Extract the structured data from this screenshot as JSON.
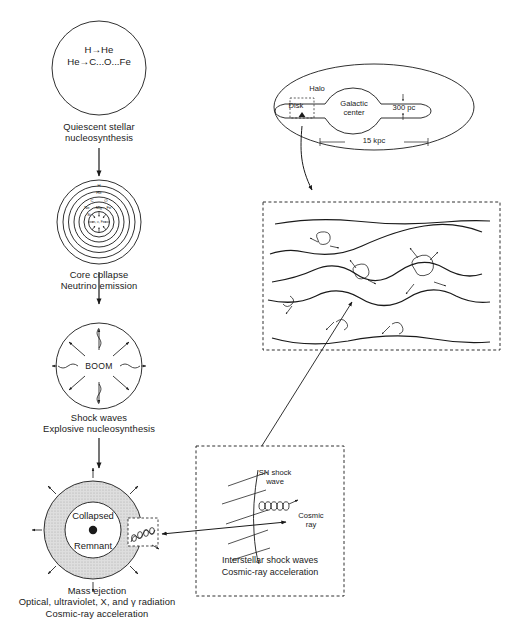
{
  "figure": {
    "name": "supernova-cosmic-ray-origin-diagram",
    "background": "#ffffff",
    "ink": "#1a1a1a",
    "shade": "#d9d9d9"
  },
  "stages": [
    {
      "id": "quiescent",
      "reactions": [
        "H→He",
        "He→C...O...Fe"
      ],
      "caption": "Quiescent stellar\nnucleosynthesis"
    },
    {
      "id": "core-collapse",
      "shells": [
        "H",
        "He",
        "C",
        "O",
        "Ne",
        "Mg",
        "Si",
        "Fe"
      ],
      "core_label": "n, ν, Fe",
      "caption": "Core collapse\nNeutrino emission"
    },
    {
      "id": "shock-waves",
      "burst_label": "BOOM",
      "caption": "Shock waves\nExplosive nucleosynthesis"
    },
    {
      "id": "mass-ejection",
      "remnant_label_top": "Collapsed",
      "remnant_label_bottom": "Remnant",
      "caption": "Mass ejection\nOptical, ultraviolet, X, and γ radiation\nCosmic-ray acceleration"
    }
  ],
  "galaxy": {
    "halo_label": "Halo",
    "disk_label": "Disk",
    "center_label": "Galactic\ncenter",
    "thickness_label": "300 pc",
    "radius_label": "15 kpc"
  },
  "ism": {
    "id": "interstellar-medium-panel",
    "description": "magnetic field lines with scattered cosmic rays"
  },
  "shock_inset": {
    "shock_label": "SN shock\nwave",
    "particle_label": "Cosmic\nray",
    "caption": "Interstellar shock waves\nCosmic-ray acceleration"
  }
}
